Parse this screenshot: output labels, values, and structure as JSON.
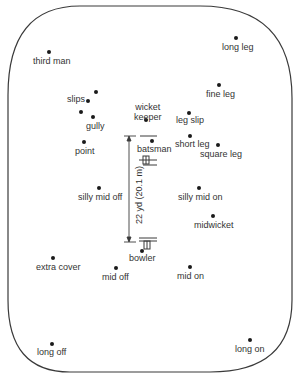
{
  "diagram": {
    "pitch_length_label": "22 yd (20.1 m)",
    "colors": {
      "line": "#3a3a3a",
      "dot": "#1a1a1a",
      "text": "#333333",
      "background": "#ffffff"
    },
    "positions": [
      {
        "id": "third-man",
        "label": "third man",
        "dot": [
          49,
          52
        ],
        "lab": [
          33,
          56
        ]
      },
      {
        "id": "long-leg",
        "label": "long leg",
        "dot": [
          236,
          38
        ],
        "lab": [
          222,
          42
        ]
      },
      {
        "id": "slips",
        "label": "slips",
        "dot": [
          96,
          92
        ],
        "lab": [
          67,
          94
        ]
      },
      {
        "id": "slip-2",
        "label": "",
        "dot": [
          88,
          101
        ],
        "lab": null
      },
      {
        "id": "slip-3",
        "label": "",
        "dot": [
          81,
          112
        ],
        "lab": null
      },
      {
        "id": "gully",
        "label": "gully",
        "dot": [
          93,
          117
        ],
        "lab": [
          86,
          121
        ]
      },
      {
        "id": "fine-leg",
        "label": "fine leg",
        "dot": [
          219,
          85
        ],
        "lab": [
          206,
          89
        ]
      },
      {
        "id": "wicket-keeper",
        "label": "wicket\nkeeper",
        "dot": [
          146,
          120
        ],
        "lab": [
          134,
          102
        ]
      },
      {
        "id": "leg-slip",
        "label": "leg slip",
        "dot": [
          189,
          113
        ],
        "lab": [
          176,
          115
        ]
      },
      {
        "id": "point",
        "label": "point",
        "dot": [
          84,
          142
        ],
        "lab": [
          75,
          146
        ]
      },
      {
        "id": "batsman",
        "label": "batsman",
        "dot": [
          152,
          141
        ],
        "lab": [
          137,
          144
        ]
      },
      {
        "id": "short-leg",
        "label": "short leg",
        "dot": [
          190,
          136
        ],
        "lab": [
          175,
          139
        ]
      },
      {
        "id": "square-leg",
        "label": "square leg",
        "dot": [
          218,
          145
        ],
        "lab": [
          200,
          149
        ]
      },
      {
        "id": "silly-mid-off",
        "label": "silly mid off",
        "dot": [
          99,
          188
        ],
        "lab": [
          78,
          192
        ]
      },
      {
        "id": "silly-mid-on",
        "label": "silly mid on",
        "dot": [
          199,
          188
        ],
        "lab": [
          178,
          192
        ]
      },
      {
        "id": "midwicket",
        "label": "midwicket",
        "dot": [
          213,
          216
        ],
        "lab": [
          194,
          220
        ]
      },
      {
        "id": "bowler",
        "label": "bowler",
        "dot": [
          142,
          251
        ],
        "lab": [
          129,
          253
        ]
      },
      {
        "id": "extra-cover",
        "label": "extra cover",
        "dot": [
          53,
          258
        ],
        "lab": [
          36,
          262
        ]
      },
      {
        "id": "mid-off",
        "label": "mid off",
        "dot": [
          116,
          268
        ],
        "lab": [
          102,
          272
        ]
      },
      {
        "id": "mid-on",
        "label": "mid on",
        "dot": [
          190,
          267
        ],
        "lab": [
          177,
          271
        ]
      },
      {
        "id": "long-off",
        "label": "long off",
        "dot": [
          52,
          344
        ],
        "lab": [
          37,
          347
        ]
      },
      {
        "id": "long-on",
        "label": "long on",
        "dot": [
          250,
          340
        ],
        "lab": [
          235,
          344
        ]
      }
    ]
  }
}
